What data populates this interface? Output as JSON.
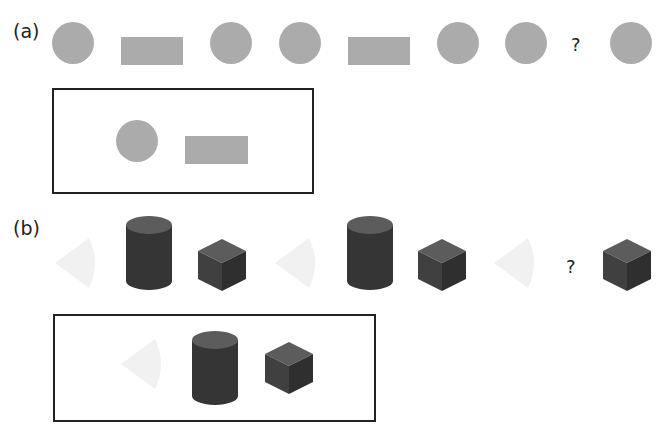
{
  "colors": {
    "gray_shape": "#ababab",
    "cone": "#f1f1f1",
    "dark_top": "#5a5a5a",
    "dark_side": "#3a3a3a",
    "dark_side2": "#2e2e2e",
    "border": "#222222"
  },
  "part_a": {
    "label": "(a)",
    "sequence": [
      "circle",
      "rectangle",
      "circle",
      "circle",
      "rectangle",
      "circle",
      "circle",
      "?",
      "circle"
    ],
    "question_mark": "?",
    "answer_box": [
      "circle",
      "rectangle"
    ]
  },
  "part_b": {
    "label": "(b)",
    "sequence": [
      "cone",
      "cylinder",
      "cube",
      "cone",
      "cylinder",
      "cube",
      "cone",
      "?",
      "cube"
    ],
    "question_mark": "?",
    "answer_box": [
      "cone",
      "cylinder",
      "cube"
    ]
  }
}
